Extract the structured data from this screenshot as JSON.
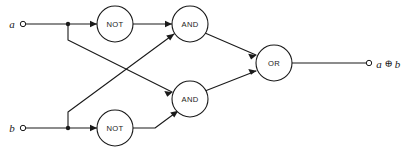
{
  "diagram": {
    "type": "logic-circuit",
    "colors": {
      "stroke": "#1a1a1a",
      "fill": "#ffffff",
      "background": "#ffffff"
    },
    "inputs": [
      {
        "id": "a",
        "label": "a",
        "x": 12,
        "y": 24,
        "terminal_x": 23,
        "terminal_y": 24
      },
      {
        "id": "b",
        "label": "b",
        "x": 12,
        "y": 128,
        "terminal_x": 23,
        "terminal_y": 128
      }
    ],
    "outputs": [
      {
        "id": "out",
        "label_operand_left": "a",
        "label_operator": "⊕",
        "label_operand_right": "b",
        "label_full": "a ⊕ b",
        "terminal_x": 369,
        "terminal_y": 63
      }
    ],
    "gates": [
      {
        "id": "not-top",
        "label": "NOT",
        "cx": 115,
        "cy": 24,
        "r": 18
      },
      {
        "id": "not-bottom",
        "label": "NOT",
        "cx": 115,
        "cy": 128,
        "r": 18
      },
      {
        "id": "and-top",
        "label": "AND",
        "cx": 190,
        "cy": 24,
        "r": 18
      },
      {
        "id": "and-bottom",
        "label": "AND",
        "cx": 190,
        "cy": 99,
        "r": 18
      },
      {
        "id": "or",
        "label": "OR",
        "cx": 274,
        "cy": 63,
        "r": 18
      }
    ],
    "junctions": [
      {
        "id": "junction-a",
        "cx": 68,
        "cy": 24,
        "r": 2.2
      },
      {
        "id": "junction-b",
        "cx": 68,
        "cy": 128,
        "r": 2.2
      }
    ],
    "wires": [
      {
        "id": "wire-a-to-not-top",
        "from": "a",
        "to": "not-top"
      },
      {
        "id": "wire-a-branch-to-and-bottom",
        "from": "junction-a",
        "to": "and-bottom"
      },
      {
        "id": "wire-b-to-not-bottom",
        "from": "b",
        "to": "not-bottom"
      },
      {
        "id": "wire-b-branch-to-and-top",
        "from": "junction-b",
        "to": "and-top"
      },
      {
        "id": "wire-not-top-to-and-top",
        "from": "not-top",
        "to": "and-top"
      },
      {
        "id": "wire-not-bottom-to-and-bottom",
        "from": "not-bottom",
        "to": "and-bottom"
      },
      {
        "id": "wire-and-top-to-or",
        "from": "and-top",
        "to": "or"
      },
      {
        "id": "wire-and-bottom-to-or",
        "from": "and-bottom",
        "to": "or"
      },
      {
        "id": "wire-or-to-output",
        "from": "or",
        "to": "out"
      }
    ]
  }
}
